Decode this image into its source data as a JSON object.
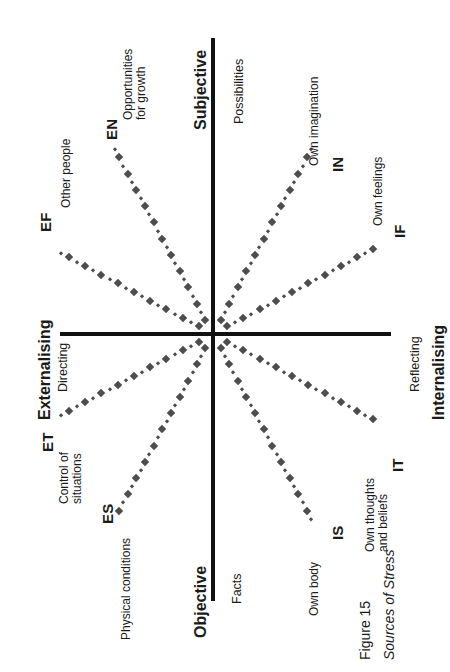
{
  "figure": {
    "caption_number": "Figure 15",
    "caption_title": "Sources of Stress",
    "marker_color": "#4d4d4d",
    "axis_color": "#111111",
    "background": "#ffffff"
  },
  "axes": {
    "top": {
      "name": "Subjective",
      "sub": "Possibilities"
    },
    "bottom": {
      "name": "Objective",
      "sub": "Facts"
    },
    "left": {
      "name": "Externalising",
      "sub": "Directing"
    },
    "right": {
      "name": "Internalising",
      "sub": "Reflecting"
    }
  },
  "chart_data": {
    "type": "scatter",
    "title": "Sources of Stress",
    "xlabel": "Externalising (Directing) ↔ Internalising (Reflecting)",
    "ylabel": "Objective (Facts) ↔ Subjective (Possibilities)",
    "grid": false,
    "legend": "none",
    "note": "Eight dotted rays radiate from the origin of a four-quadrant map; each ray is labelled with a two-letter type code and its source of stress.",
    "series": [
      {
        "name": "EF",
        "label": "EF",
        "description": "Other people",
        "quadrant": "upper-left",
        "angle_deg": 152
      },
      {
        "name": "EN",
        "label": "EN",
        "description": "Opportunities\nfor growth",
        "quadrant": "upper-left",
        "angle_deg": 118
      },
      {
        "name": "IN",
        "label": "IN",
        "description": "Own imagination",
        "quadrant": "upper-right",
        "angle_deg": 62
      },
      {
        "name": "IF",
        "label": "IF",
        "description": "Own feelings",
        "quadrant": "upper-right",
        "angle_deg": 28
      },
      {
        "name": "ET",
        "label": "ET",
        "description": "Control of\nsituations",
        "quadrant": "lower-left",
        "angle_deg": 208
      },
      {
        "name": "ES",
        "label": "ES",
        "description": "Physical conditions",
        "quadrant": "lower-left",
        "angle_deg": 242
      },
      {
        "name": "IS",
        "label": "IS",
        "description": "Own body",
        "quadrant": "lower-right",
        "angle_deg": 298
      },
      {
        "name": "IT",
        "label": "IT",
        "description": "Own thoughts\nand beliefs",
        "quadrant": "lower-right",
        "angle_deg": 332
      }
    ]
  }
}
